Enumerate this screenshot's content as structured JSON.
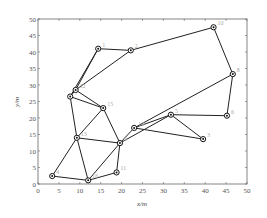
{
  "chart_data": {
    "type": "scatter",
    "subtype": "network-graph",
    "title": "",
    "xlabel": "x/m",
    "ylabel": "y/m",
    "xlim": [
      0,
      50
    ],
    "ylim": [
      0,
      50
    ],
    "grid": false,
    "x_ticks": [
      0,
      5,
      10,
      15,
      20,
      25,
      30,
      35,
      40,
      45,
      50
    ],
    "y_ticks": [
      0,
      5,
      10,
      15,
      20,
      25,
      30,
      35,
      40,
      45,
      50
    ],
    "nodes": [
      {
        "id": "1",
        "x": 14.4,
        "y": 41.0
      },
      {
        "id": "2",
        "x": 22.2,
        "y": 40.5
      },
      {
        "id": "3",
        "x": 39.5,
        "y": 13.6
      },
      {
        "id": "4",
        "x": 3.4,
        "y": 2.4
      },
      {
        "id": "5",
        "x": 31.8,
        "y": 21.0
      },
      {
        "id": "6",
        "x": 45.2,
        "y": 20.7
      },
      {
        "id": "7",
        "x": 7.7,
        "y": 26.5
      },
      {
        "id": "8",
        "x": 46.6,
        "y": 33.3
      },
      {
        "id": "9",
        "x": 19.6,
        "y": 12.4
      },
      {
        "id": "10",
        "x": 42.0,
        "y": 47.5
      },
      {
        "id": "11",
        "x": 18.8,
        "y": 3.5
      },
      {
        "id": "12",
        "x": 9.0,
        "y": 28.5
      },
      {
        "id": "13",
        "x": 9.3,
        "y": 14.0
      },
      {
        "id": "14",
        "x": 23.0,
        "y": 17.0
      },
      {
        "id": "15",
        "x": 15.6,
        "y": 23.0
      },
      {
        "id": "16",
        "x": 12.0,
        "y": 1.1
      }
    ],
    "edges": [
      [
        "1",
        "12"
      ],
      [
        "1",
        "7"
      ],
      [
        "1",
        "2"
      ],
      [
        "2",
        "12"
      ],
      [
        "2",
        "10"
      ],
      [
        "10",
        "8"
      ],
      [
        "8",
        "14"
      ],
      [
        "8",
        "6"
      ],
      [
        "12",
        "7"
      ],
      [
        "7",
        "15"
      ],
      [
        "12",
        "15"
      ],
      [
        "7",
        "13"
      ],
      [
        "15",
        "13"
      ],
      [
        "15",
        "9"
      ],
      [
        "13",
        "9"
      ],
      [
        "13",
        "4"
      ],
      [
        "13",
        "16"
      ],
      [
        "4",
        "16"
      ],
      [
        "16",
        "9"
      ],
      [
        "16",
        "11"
      ],
      [
        "11",
        "9"
      ],
      [
        "9",
        "14"
      ],
      [
        "9",
        "5"
      ],
      [
        "14",
        "5"
      ],
      [
        "14",
        "3"
      ],
      [
        "5",
        "3"
      ],
      [
        "5",
        "6"
      ]
    ]
  },
  "axes": {
    "xlabel": "x/m",
    "ylabel": "y/m"
  }
}
